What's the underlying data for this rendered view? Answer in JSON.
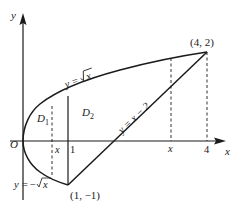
{
  "figure": {
    "type": "region-between-curves",
    "axes": {
      "x_label": "x",
      "y_label": "y",
      "origin_label": "O"
    },
    "curves": [
      {
        "id": "upper",
        "label": "y = √x",
        "label_parts": {
          "lhs": "y",
          "eq": "=",
          "rhs": "x"
        }
      },
      {
        "id": "lower",
        "label": "y = −√x",
        "label_parts": {
          "lhs": "y",
          "eq": "=",
          "neg": "−",
          "rhs": "x"
        }
      },
      {
        "id": "line",
        "label": "y = x − 2"
      }
    ],
    "points": [
      {
        "label": "(4, 2)",
        "x": 4,
        "y": 2
      },
      {
        "label": "(1, −1)",
        "x": 1,
        "y": -1
      }
    ],
    "regions": [
      {
        "name": "D",
        "sub": "1",
        "domain": "0 ≤ x ≤ 1"
      },
      {
        "name": "D",
        "sub": "2",
        "domain": "1 ≤ x ≤ 4"
      }
    ],
    "x_ticks": [
      {
        "label": "x",
        "italic": true,
        "value": "x (in D1)"
      },
      {
        "label": "1",
        "italic": false,
        "value": 1
      },
      {
        "label": "x",
        "italic": true,
        "value": "x (in D2)"
      },
      {
        "label": "4",
        "italic": false,
        "value": 4
      }
    ]
  },
  "colors": {
    "stroke": "#1a1a1a",
    "background": "#ffffff"
  }
}
